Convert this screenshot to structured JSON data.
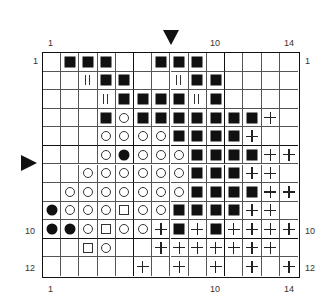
{
  "chart": {
    "columns": 14,
    "rows": 12,
    "legend_symbols": {
      "B": "filled-square",
      "O": "open-circle",
      "D": "filled-circle",
      "S": "open-square",
      "P": "plus",
      "T": "double-bar",
      ".": "empty"
    },
    "grid": [
      ".BBB..BBB.....",
      "..TBB..TBB....",
      "...TBBBBTB....",
      "...BOBBBBBBBP.",
      "...OOOOBBBBP..",
      "...ODOOOBBBBPP",
      "..OOOOOOBBBPP.",
      ".OOOOOOOBBBBPP",
      "DOOOSOOBBBBPP.",
      "DDOSOOPBPBPPPP",
      "..SO..PPPPPPP.",
      ".....P.P.P.P.P"
    ],
    "thick_lines": {
      "after_columns": [
        5,
        10
      ],
      "after_rows": [
        5,
        10
      ]
    }
  },
  "labels": {
    "top": [
      {
        "text": "1",
        "col": 1
      },
      {
        "text": "10",
        "col": 10
      },
      {
        "text": "14",
        "col": 14
      }
    ],
    "bottom": [
      {
        "text": "1",
        "col": 1
      },
      {
        "text": "10",
        "col": 10
      },
      {
        "text": "14",
        "col": 14
      }
    ],
    "left": [
      {
        "text": "1",
        "row": 1
      },
      {
        "text": "10",
        "row": 10
      },
      {
        "text": "12",
        "row": 12
      }
    ],
    "right": [
      {
        "text": "1",
        "row": 1
      },
      {
        "text": "10",
        "row": 10
      },
      {
        "text": "12",
        "row": 12
      }
    ]
  },
  "markers": {
    "top_arrow": {
      "direction": "down",
      "between_columns": [
        7,
        8
      ]
    },
    "left_arrow": {
      "direction": "right",
      "between_rows": [
        6,
        7
      ]
    }
  }
}
